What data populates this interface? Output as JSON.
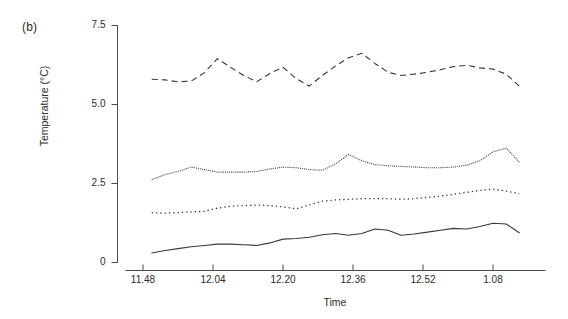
{
  "figure": {
    "panel_label": "(b)",
    "background": "#ffffff",
    "line_color": "#38383c",
    "axis_color": "#4a4a4a"
  },
  "chart_data": {
    "type": "line",
    "title": "",
    "panel": "(b)",
    "xlabel": "Time",
    "ylabel": "Temperature (°C)",
    "ylim": [
      0,
      7.5
    ],
    "yticks": [
      0,
      2.5,
      5.0,
      7.5
    ],
    "ytick_labels": [
      "0",
      "2.5",
      "5.0",
      "7.5"
    ],
    "xtick_labels": [
      "11.48",
      "12.04",
      "12.20",
      "12.36",
      "12.52",
      "1.08"
    ],
    "xtick_values": [
      0,
      16,
      32,
      48,
      64,
      80
    ],
    "xlim": [
      -4,
      92
    ],
    "grid": false,
    "legend": "none",
    "x": [
      2,
      5,
      8,
      11,
      14,
      17,
      20,
      23,
      26,
      29,
      32,
      35,
      38,
      41,
      44,
      47,
      50,
      53,
      56,
      59,
      62,
      65,
      68,
      71,
      74,
      77,
      80,
      83,
      86
    ],
    "series": [
      {
        "name": "series-1-dashed",
        "style": "dashed",
        "values": [
          5.8,
          5.78,
          5.72,
          5.74,
          6.0,
          6.45,
          6.18,
          5.92,
          5.72,
          5.98,
          6.18,
          5.82,
          5.58,
          5.92,
          6.22,
          6.48,
          6.62,
          6.3,
          6.02,
          5.92,
          5.96,
          6.02,
          6.1,
          6.2,
          6.24,
          6.16,
          6.12,
          5.96,
          5.58
        ]
      },
      {
        "name": "series-2-fine-dotted",
        "style": "fine-dotted",
        "values": [
          2.62,
          2.78,
          2.88,
          3.02,
          2.94,
          2.86,
          2.86,
          2.86,
          2.88,
          2.96,
          3.02,
          3.0,
          2.94,
          2.92,
          3.12,
          3.42,
          3.22,
          3.1,
          3.06,
          3.04,
          3.02,
          3.0,
          3.0,
          3.02,
          3.08,
          3.22,
          3.5,
          3.62,
          3.18
        ]
      },
      {
        "name": "series-3-coarse-dotted",
        "style": "coarse-dotted",
        "values": [
          1.58,
          1.56,
          1.58,
          1.6,
          1.62,
          1.72,
          1.78,
          1.8,
          1.82,
          1.8,
          1.76,
          1.7,
          1.82,
          1.94,
          1.98,
          2.0,
          2.02,
          2.02,
          2.02,
          2.0,
          2.02,
          2.06,
          2.1,
          2.16,
          2.22,
          2.28,
          2.32,
          2.26,
          2.18
        ]
      },
      {
        "name": "series-4-solid",
        "style": "solid",
        "values": [
          0.3,
          0.38,
          0.44,
          0.5,
          0.54,
          0.58,
          0.58,
          0.56,
          0.54,
          0.62,
          0.74,
          0.76,
          0.8,
          0.88,
          0.92,
          0.86,
          0.92,
          1.06,
          1.02,
          0.86,
          0.9,
          0.96,
          1.02,
          1.08,
          1.06,
          1.14,
          1.24,
          1.22,
          0.94
        ]
      }
    ]
  }
}
